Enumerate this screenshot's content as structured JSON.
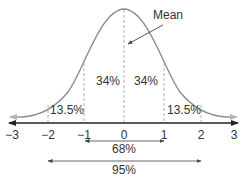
{
  "diagram": {
    "mean_label": "Mean",
    "regions": [
      {
        "label": "13.5%",
        "from": -2,
        "to": -1
      },
      {
        "label": "34%",
        "from": -1,
        "to": 0
      },
      {
        "label": "34%",
        "from": 0,
        "to": 1
      },
      {
        "label": "13.5%",
        "from": 1,
        "to": 2
      }
    ],
    "axis_ticks": [
      "−3",
      "−2",
      "−1",
      "0",
      "1",
      "2",
      "3"
    ],
    "ranges": [
      {
        "label": "68%",
        "from": -1,
        "to": 1
      },
      {
        "label": "95%",
        "from": -2,
        "to": 2
      }
    ],
    "colors": {
      "curve": "#8c8c8c",
      "axis": "#222222",
      "dashed": "#b0b0b0",
      "text": "#333333"
    }
  }
}
